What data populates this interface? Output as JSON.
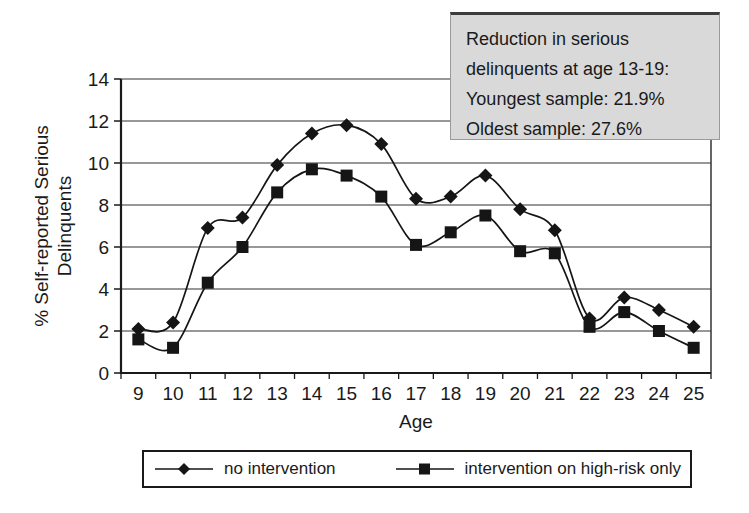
{
  "chart_data": {
    "type": "line",
    "x": [
      9,
      10,
      11,
      12,
      13,
      14,
      15,
      16,
      17,
      18,
      19,
      20,
      21,
      22,
      23,
      24,
      25
    ],
    "xlabel": "Age",
    "ylabel": "% Self-reported Serious Delinquents",
    "ylim": [
      0,
      14
    ],
    "yticks": [
      0,
      2,
      4,
      6,
      8,
      10,
      12,
      14
    ],
    "grid": "horizontal",
    "legend_position": "bottom",
    "series": [
      {
        "name": "no intervention",
        "marker": "diamond",
        "values": [
          2.1,
          2.4,
          6.9,
          7.4,
          9.9,
          11.4,
          11.8,
          10.9,
          8.3,
          8.4,
          9.4,
          7.8,
          6.8,
          2.6,
          3.6,
          3.0,
          2.2
        ]
      },
      {
        "name": "intervention on high-risk only",
        "marker": "square",
        "values": [
          1.6,
          1.2,
          4.3,
          6.0,
          8.6,
          9.7,
          9.4,
          8.4,
          6.1,
          6.7,
          7.5,
          5.8,
          5.7,
          2.2,
          2.9,
          2.0,
          1.2
        ]
      }
    ]
  },
  "annotation": {
    "lines": [
      "Reduction in serious",
      "delinquents at age 13-19:",
      "Youngest sample: 21.9%",
      "Oldest sample: 27.6%"
    ]
  },
  "colors": {
    "line": "#151515",
    "grid": "#333333",
    "axis": "#1a1a1a",
    "annotation_bg": "#d9d9d9",
    "background": "#ffffff"
  }
}
